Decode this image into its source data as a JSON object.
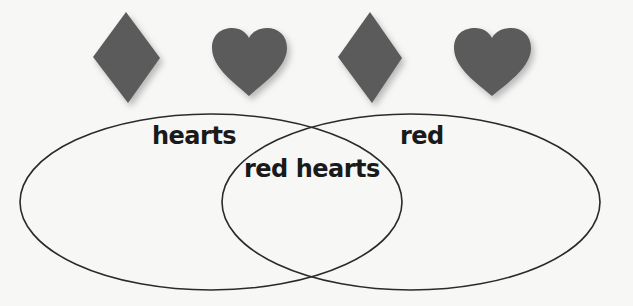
{
  "diagram": {
    "type": "venn",
    "sets": [
      {
        "id": "left",
        "label": "hearts"
      },
      {
        "id": "right",
        "label": "red"
      }
    ],
    "intersection": {
      "label": "red hearts"
    },
    "cards": [
      {
        "shape": "diamond",
        "position": 1
      },
      {
        "shape": "heart",
        "position": 2
      },
      {
        "shape": "diamond",
        "position": 3
      },
      {
        "shape": "heart",
        "position": 4
      }
    ],
    "colors": {
      "shape_fill": "#5b5b5b",
      "outline": "#2a2a2a",
      "background": "#f7f7f6",
      "text": "#1a1a1a"
    }
  }
}
